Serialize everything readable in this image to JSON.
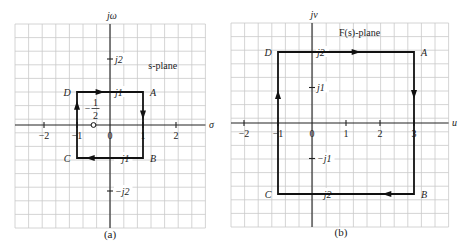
{
  "panels": [
    {
      "id": "a",
      "caption": "(a)",
      "plane_label": "s-plane",
      "real_axis_label": "σ",
      "imag_axis_label": "jω",
      "grid": {
        "x0": 15,
        "y0": 24,
        "cols": 14,
        "rows": 15,
        "cell": 13.6
      },
      "origin": {
        "x": 110,
        "y": 125
      },
      "unit_px": 33,
      "real_ticks": [
        {
          "value": -2,
          "label": "−2"
        },
        {
          "value": -1,
          "label": "−1"
        },
        {
          "value": 0,
          "label": "0"
        },
        {
          "value": 1,
          "label": "1"
        },
        {
          "value": 2,
          "label": "2"
        }
      ],
      "imag_ticks": [
        {
          "value": 2,
          "label": "j2"
        },
        {
          "value": 1,
          "label": "j1"
        },
        {
          "value": -1,
          "label": "−j1"
        },
        {
          "value": -2,
          "label": "−j2"
        }
      ],
      "contour": [
        {
          "name": "D",
          "re": -1,
          "im": 1
        },
        {
          "name": "A",
          "re": 1,
          "im": 1
        },
        {
          "name": "B",
          "re": 1,
          "im": -1
        },
        {
          "name": "C",
          "re": -1,
          "im": -1
        }
      ],
      "zero_marker": {
        "re": -0.5,
        "im": 0,
        "label_num": "1",
        "label_den": "2",
        "label_sign": "−"
      }
    },
    {
      "id": "b",
      "caption": "(b)",
      "plane_label": "F(s)-plane",
      "real_axis_label": "u",
      "imag_axis_label": "jv",
      "grid": {
        "x0": 231,
        "y0": 23,
        "cols": 16,
        "rows": 15,
        "cell": 13.6
      },
      "origin": {
        "x": 312,
        "y": 123
      },
      "unit_px": 34,
      "unit_py": 35.5,
      "real_ticks": [
        {
          "value": -2,
          "label": "−2"
        },
        {
          "value": -1,
          "label": "−1"
        },
        {
          "value": 0,
          "label": "0"
        },
        {
          "value": 1,
          "label": "1"
        },
        {
          "value": 2,
          "label": "2"
        },
        {
          "value": 3,
          "label": "3"
        }
      ],
      "imag_ticks": [
        {
          "value": 2,
          "label": "j2"
        },
        {
          "value": 1,
          "label": "j1"
        },
        {
          "value": -1,
          "label": "−j1"
        },
        {
          "value": -2,
          "label": "−j2"
        }
      ],
      "contour": [
        {
          "name": "D",
          "re": -1,
          "im": 2
        },
        {
          "name": "A",
          "re": 3,
          "im": 2
        },
        {
          "name": "B",
          "re": 3,
          "im": -2
        },
        {
          "name": "C",
          "re": -1,
          "im": -2
        }
      ]
    }
  ]
}
